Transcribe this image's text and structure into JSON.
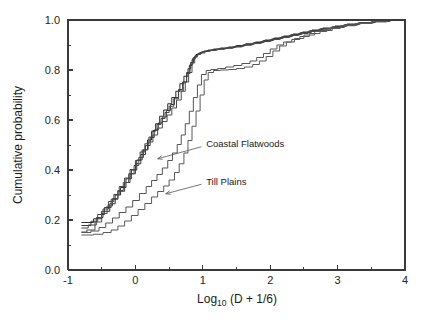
{
  "figure": {
    "background_color": "#ffffff",
    "frame_color": "#3a3a3a"
  },
  "chart_data": {
    "type": "line",
    "title": "",
    "subtitle": "",
    "xlabel": "Log10 (D + 1/6)",
    "xlabel_base": "Log",
    "xlabel_subscript": "10",
    "xlabel_rest": " (D + 1/6)",
    "ylabel": "Cumulative probability",
    "xlim": [
      -1,
      4
    ],
    "ylim": [
      0.0,
      1.0
    ],
    "grid": false,
    "legend_position": "none",
    "step_type": "post",
    "xticks": [
      -1,
      0,
      1,
      2,
      3,
      4
    ],
    "xticklabels": [
      "-1",
      "0",
      "1",
      "2",
      "3",
      "4"
    ],
    "xminorticks": [
      -0.5,
      0.5,
      1.5,
      2.5,
      3.5
    ],
    "yticks": [
      0.0,
      0.2,
      0.4,
      0.6,
      0.8,
      1.0
    ],
    "yticklabels": [
      "0.0",
      "0.2",
      "0.4",
      "0.6",
      "0.8",
      "1.0"
    ],
    "yminorticks": [
      0.1,
      0.3,
      0.5,
      0.7,
      0.9
    ],
    "annotations": [
      {
        "text": "Coastal Flatwoods",
        "text_x": 1.05,
        "text_y": 0.505,
        "arrow_from_x": 0.98,
        "arrow_from_y": 0.493,
        "arrow_to_x": 0.33,
        "arrow_to_y": 0.445
      },
      {
        "text": "Till Plains",
        "text_x": 1.05,
        "text_y": 0.355,
        "arrow_from_x": 0.98,
        "arrow_from_y": 0.343,
        "arrow_to_x": 0.45,
        "arrow_to_y": 0.305
      }
    ],
    "series": [
      {
        "name": "Coastal Flatwoods 1",
        "group": "Coastal Flatwoods",
        "color": "#2a2a2a",
        "width": 1.0,
        "x": [
          -0.8,
          -0.62,
          -0.5,
          -0.38,
          -0.3,
          -0.22,
          -0.14,
          -0.06,
          0.02,
          0.1,
          0.18,
          0.24,
          0.3,
          0.36,
          0.42,
          0.48,
          0.54,
          0.6,
          0.66,
          0.72,
          0.78,
          0.82,
          0.86,
          0.9,
          0.94,
          0.98,
          1.02,
          1.08,
          1.16,
          1.26,
          1.38,
          1.5,
          1.64,
          1.78,
          1.92,
          2.06,
          2.2,
          2.34,
          2.48,
          2.62,
          2.78,
          2.96,
          3.14,
          3.34,
          3.56,
          3.78,
          3.84
        ],
        "y": [
          0.19,
          0.205,
          0.235,
          0.265,
          0.3,
          0.33,
          0.365,
          0.4,
          0.44,
          0.48,
          0.52,
          0.555,
          0.585,
          0.615,
          0.64,
          0.665,
          0.69,
          0.715,
          0.745,
          0.775,
          0.805,
          0.83,
          0.85,
          0.862,
          0.868,
          0.872,
          0.876,
          0.88,
          0.884,
          0.888,
          0.892,
          0.898,
          0.905,
          0.912,
          0.92,
          0.928,
          0.936,
          0.944,
          0.952,
          0.96,
          0.968,
          0.976,
          0.984,
          0.99,
          0.995,
          1.0,
          1.0
        ]
      },
      {
        "name": "Coastal Flatwoods 2",
        "group": "Coastal Flatwoods",
        "color": "#3a3a3a",
        "width": 1.0,
        "x": [
          -0.8,
          -0.66,
          -0.56,
          -0.46,
          -0.36,
          -0.26,
          -0.16,
          -0.08,
          0.0,
          0.08,
          0.15,
          0.22,
          0.28,
          0.34,
          0.4,
          0.46,
          0.52,
          0.58,
          0.64,
          0.7,
          0.76,
          0.8,
          0.84,
          0.88,
          0.92,
          0.96,
          1.0,
          1.06,
          1.14,
          1.24,
          1.36,
          1.48,
          1.62,
          1.76,
          1.9,
          2.04,
          2.18,
          2.32,
          2.46,
          2.6,
          2.76,
          2.94,
          3.12,
          3.32,
          3.54,
          3.76,
          3.84
        ],
        "y": [
          0.178,
          0.195,
          0.222,
          0.25,
          0.283,
          0.315,
          0.35,
          0.385,
          0.425,
          0.462,
          0.498,
          0.53,
          0.56,
          0.588,
          0.612,
          0.638,
          0.662,
          0.69,
          0.722,
          0.752,
          0.79,
          0.818,
          0.842,
          0.856,
          0.864,
          0.87,
          0.874,
          0.878,
          0.882,
          0.886,
          0.89,
          0.896,
          0.903,
          0.91,
          0.918,
          0.926,
          0.934,
          0.942,
          0.95,
          0.958,
          0.966,
          0.974,
          0.982,
          0.989,
          0.994,
          1.0,
          1.0
        ]
      },
      {
        "name": "Coastal Flatwoods 3",
        "group": "Coastal Flatwoods",
        "color": "#444444",
        "width": 1.0,
        "x": [
          -0.8,
          -0.7,
          -0.58,
          -0.48,
          -0.4,
          -0.32,
          -0.24,
          -0.16,
          -0.08,
          0.0,
          0.07,
          0.14,
          0.2,
          0.26,
          0.32,
          0.38,
          0.44,
          0.5,
          0.57,
          0.64,
          0.71,
          0.76,
          0.81,
          0.85,
          0.89,
          0.93,
          0.98,
          1.04,
          1.12,
          1.22,
          1.34,
          1.46,
          1.6,
          1.74,
          1.88,
          2.02,
          2.16,
          2.3,
          2.44,
          2.58,
          2.74,
          2.92,
          3.1,
          3.3,
          3.52,
          3.74,
          3.84
        ],
        "y": [
          0.168,
          0.18,
          0.21,
          0.244,
          0.274,
          0.302,
          0.334,
          0.368,
          0.402,
          0.438,
          0.472,
          0.505,
          0.532,
          0.558,
          0.582,
          0.606,
          0.63,
          0.655,
          0.685,
          0.716,
          0.752,
          0.786,
          0.822,
          0.846,
          0.858,
          0.866,
          0.872,
          0.876,
          0.88,
          0.884,
          0.888,
          0.894,
          0.901,
          0.908,
          0.916,
          0.924,
          0.932,
          0.941,
          0.949,
          0.957,
          0.965,
          0.973,
          0.981,
          0.988,
          0.994,
          1.0,
          1.0
        ]
      },
      {
        "name": "Coastal Flatwoods 4",
        "group": "Coastal Flatwoods",
        "color": "#4a4a4a",
        "width": 1.0,
        "x": [
          -0.8,
          -0.72,
          -0.6,
          -0.5,
          -0.42,
          -0.34,
          -0.26,
          -0.18,
          -0.1,
          -0.02,
          0.05,
          0.12,
          0.19,
          0.26,
          0.33,
          0.4,
          0.47,
          0.54,
          0.61,
          0.68,
          0.74,
          0.79,
          0.84,
          0.88,
          0.92,
          0.97,
          1.03,
          1.1,
          1.2,
          1.32,
          1.44,
          1.58,
          1.72,
          1.86,
          2.0,
          2.14,
          2.28,
          2.42,
          2.56,
          2.72,
          2.9,
          3.08,
          3.28,
          3.5,
          3.72,
          3.84
        ],
        "y": [
          0.152,
          0.16,
          0.192,
          0.226,
          0.256,
          0.286,
          0.318,
          0.35,
          0.385,
          0.418,
          0.45,
          0.482,
          0.512,
          0.54,
          0.568,
          0.594,
          0.62,
          0.648,
          0.68,
          0.715,
          0.752,
          0.79,
          0.828,
          0.852,
          0.862,
          0.868,
          0.874,
          0.878,
          0.883,
          0.887,
          0.892,
          0.899,
          0.906,
          0.914,
          0.922,
          0.93,
          0.938,
          0.946,
          0.954,
          0.963,
          0.971,
          0.979,
          0.986,
          0.993,
          1.0,
          1.0
        ]
      },
      {
        "name": "Till Plains 1",
        "group": "Till Plains",
        "color": "#555555",
        "width": 1.0,
        "x": [
          -0.8,
          -0.66,
          -0.54,
          -0.44,
          -0.34,
          -0.24,
          -0.14,
          -0.04,
          0.06,
          0.16,
          0.24,
          0.32,
          0.4,
          0.48,
          0.55,
          0.62,
          0.68,
          0.74,
          0.8,
          0.86,
          0.92,
          0.98,
          1.05,
          1.12,
          1.22,
          1.34,
          1.46,
          1.58,
          1.7,
          1.8,
          1.9,
          2.0,
          2.1,
          2.2,
          2.32,
          2.44,
          2.58,
          2.74,
          2.92,
          3.1,
          3.3,
          3.52,
          3.74,
          3.84
        ],
        "y": [
          0.15,
          0.156,
          0.17,
          0.188,
          0.208,
          0.23,
          0.252,
          0.278,
          0.306,
          0.334,
          0.358,
          0.382,
          0.408,
          0.438,
          0.468,
          0.502,
          0.54,
          0.585,
          0.635,
          0.69,
          0.74,
          0.782,
          0.798,
          0.802,
          0.806,
          0.812,
          0.818,
          0.826,
          0.836,
          0.85,
          0.866,
          0.884,
          0.9,
          0.912,
          0.922,
          0.934,
          0.946,
          0.958,
          0.97,
          0.98,
          0.988,
          0.994,
          1.0,
          1.0
        ]
      },
      {
        "name": "Till Plains 2",
        "group": "Till Plains",
        "color": "#5a5a5a",
        "width": 1.0,
        "x": [
          -0.8,
          -0.62,
          -0.48,
          -0.36,
          -0.26,
          -0.16,
          -0.06,
          0.04,
          0.14,
          0.24,
          0.33,
          0.42,
          0.5,
          0.58,
          0.65,
          0.72,
          0.78,
          0.84,
          0.9,
          0.96,
          1.02,
          1.08,
          1.16,
          1.26,
          1.38,
          1.5,
          1.62,
          1.74,
          1.84,
          1.94,
          2.04,
          2.14,
          2.24,
          2.36,
          2.5,
          2.66,
          2.84,
          3.04,
          3.26,
          3.5,
          3.74,
          3.84
        ],
        "y": [
          0.14,
          0.143,
          0.15,
          0.16,
          0.176,
          0.196,
          0.218,
          0.242,
          0.266,
          0.292,
          0.314,
          0.336,
          0.36,
          0.39,
          0.425,
          0.468,
          0.518,
          0.575,
          0.636,
          0.7,
          0.76,
          0.79,
          0.798,
          0.8,
          0.802,
          0.806,
          0.812,
          0.822,
          0.836,
          0.854,
          0.876,
          0.896,
          0.912,
          0.926,
          0.94,
          0.954,
          0.966,
          0.977,
          0.986,
          0.993,
          1.0,
          1.0
        ]
      }
    ]
  }
}
